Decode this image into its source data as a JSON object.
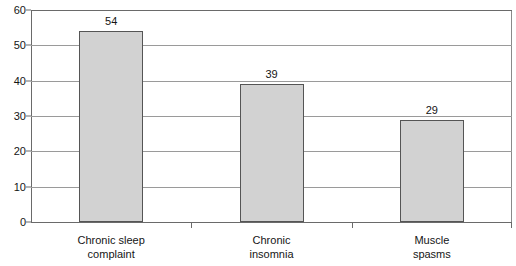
{
  "chart_data": {
    "type": "bar",
    "title": "",
    "subtitle": "",
    "xlabel": "",
    "ylabel": "",
    "categories": [
      "Chronic sleep complaint",
      "Chronic insomnia",
      "Muscle spasms"
    ],
    "category_lines": [
      [
        "Chronic sleep",
        "complaint"
      ],
      [
        "Chronic",
        "insomnia"
      ],
      [
        "Muscle",
        "spasms"
      ]
    ],
    "values": [
      54,
      39,
      29
    ],
    "value_labels": [
      "54",
      "39",
      "29"
    ],
    "ylim": [
      0,
      60
    ],
    "ytick_values": [
      0,
      10,
      20,
      30,
      40,
      50,
      60
    ],
    "ytick_labels": [
      "0",
      "10",
      "20",
      "30",
      "40",
      "50",
      "60"
    ],
    "grid": true,
    "grid_axis": "y",
    "legend": false,
    "legend_position": "none",
    "bar_fill_color": "#d2d2d2",
    "bar_edge_color": "#555555",
    "grid_color": "#9a9a9a",
    "axis_color": "#6a6a6a",
    "text_color": "#151515",
    "background_color": "#ffffff"
  }
}
